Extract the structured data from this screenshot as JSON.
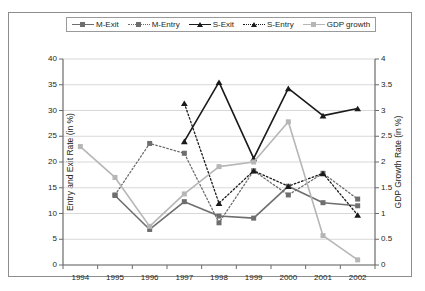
{
  "top_bleed_text": "",
  "legend": {
    "position": "top-center",
    "items": [
      {
        "label": "M-Exit",
        "color": "#6e6e6e",
        "line": "solid",
        "marker": "square"
      },
      {
        "label": "M-Entry",
        "color": "#6e6e6e",
        "line": "dotted",
        "marker": "square"
      },
      {
        "label": "S-Exit",
        "color": "#1a1a1a",
        "line": "solid",
        "marker": "triangle"
      },
      {
        "label": "S-Entry",
        "color": "#1a1a1a",
        "line": "dotted",
        "marker": "triangle"
      },
      {
        "label": "GDP growth",
        "color": "#b6b6b6",
        "line": "solid",
        "marker": "square"
      }
    ]
  },
  "chart_data": {
    "type": "line",
    "title": "",
    "xlabel": "",
    "ylabel": "Entry and Exit Rate (in %)",
    "y2label": "GDP Growth Rate (in %)",
    "x": [
      1994,
      1995,
      1996,
      1997,
      1998,
      1999,
      2000,
      2001,
      2002
    ],
    "xtick_labels": [
      "1994",
      "1995",
      "1996",
      "1997",
      "1998",
      "1999",
      "2000",
      "2001",
      "2002"
    ],
    "ylim": [
      0,
      40
    ],
    "yticks": [
      0,
      5,
      10,
      15,
      20,
      25,
      30,
      35,
      40
    ],
    "ytick_labels": [
      "0",
      "5",
      "10",
      "15",
      "20",
      "25",
      "30",
      "35",
      "40"
    ],
    "y2lim": [
      0,
      4
    ],
    "y2ticks": [
      0,
      0.5,
      1,
      1.5,
      2,
      2.5,
      3,
      3.5,
      4
    ],
    "y2tick_labels": [
      "0",
      "0.5",
      "1",
      "1.5",
      "2",
      "2.5",
      "3",
      "3.5",
      "4"
    ],
    "grid": "horizontal",
    "series": [
      {
        "name": "M-Exit",
        "axis": "left",
        "color": "#6e6e6e",
        "line": "solid",
        "marker": "square",
        "values": [
          null,
          13.5,
          6.9,
          12.3,
          9.5,
          9.1,
          15.3,
          12.1,
          11.5
        ]
      },
      {
        "name": "M-Entry",
        "axis": "left",
        "color": "#6e6e6e",
        "line": "dotted",
        "marker": "square",
        "values": [
          null,
          13.6,
          23.6,
          21.7,
          8.2,
          18.3,
          13.6,
          17.8,
          12.8
        ]
      },
      {
        "name": "S-Exit",
        "axis": "left",
        "color": "#1a1a1a",
        "line": "solid",
        "marker": "triangle",
        "values": [
          null,
          null,
          null,
          24.0,
          35.5,
          20.7,
          34.3,
          29.0,
          30.4
        ]
      },
      {
        "name": "S-Entry",
        "axis": "left",
        "color": "#1a1a1a",
        "line": "dotted",
        "marker": "triangle",
        "values": [
          null,
          null,
          null,
          31.4,
          12.0,
          18.3,
          15.3,
          17.8,
          9.7
        ]
      },
      {
        "name": "GDP growth",
        "axis": "right",
        "color": "#b6b6b6",
        "line": "solid",
        "marker": "square",
        "values": [
          2.3,
          1.7,
          0.75,
          1.38,
          1.91,
          2.0,
          2.78,
          0.57,
          0.1
        ]
      }
    ]
  }
}
